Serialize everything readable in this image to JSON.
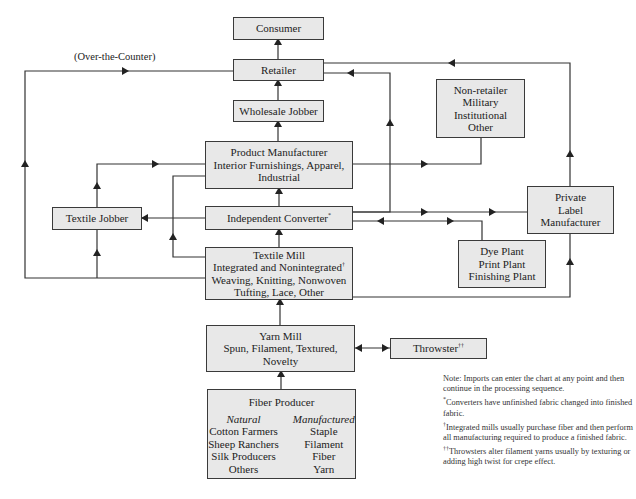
{
  "diagram": {
    "nodes": {
      "consumer": {
        "label": "Consumer"
      },
      "retailer": {
        "label": "Retailer"
      },
      "wholesale_jobber": {
        "label": "Wholesale Jobber"
      },
      "product_manufacturer": {
        "lines": [
          "Product Manufacturer",
          "Interior Furnishings, Apparel,",
          "Industrial"
        ]
      },
      "textile_jobber": {
        "label": "Textile Jobber"
      },
      "independent_converter": {
        "label": "Independent Converter",
        "mark": "*"
      },
      "textile_mill": {
        "lines": [
          "Textile Mill",
          "Integrated and Nonintegrated",
          "Weaving, Knitting, Nonwoven",
          "Tufting, Lace, Other"
        ],
        "mark": "†"
      },
      "yarn_mill": {
        "lines": [
          "Yarn Mill",
          "Spun, Filament, Textured,",
          "Novelty"
        ]
      },
      "throwster": {
        "label": "Throwster",
        "mark": "††"
      },
      "fiber_producer": {
        "title": "Fiber Producer",
        "natural": {
          "heading": "Natural",
          "items": [
            "Cotton Farmers",
            "Sheep Ranchers",
            "Silk Producers",
            "Others"
          ]
        },
        "manufactured": {
          "heading": "Manufactured",
          "items": [
            "Staple",
            "Filament",
            "Fiber",
            "Yarn"
          ]
        }
      },
      "non_retailer": {
        "lines": [
          "Non-retailer",
          "Military",
          "Institutional",
          "Other"
        ]
      },
      "private_label": {
        "lines": [
          "Private",
          "Label",
          "Manufacturer"
        ]
      },
      "dye_plant": {
        "lines": [
          "Dye Plant",
          "Print Plant",
          "Finishing Plant"
        ]
      }
    },
    "edge_labels": {
      "over_the_counter": "(Over-the-Counter)"
    },
    "notes": {
      "imports": "Note: Imports can enter the chart at any point and then continue in the processing sequence.",
      "converters": {
        "mark": "*",
        "text": "Converters have unfinished fabric changed into finished fabric."
      },
      "integrated": {
        "mark": "†",
        "text": "Integrated mills usually purchase fiber and then perform all manufacturing required to produce a finished fabric."
      },
      "throwsters": {
        "mark": "††",
        "text": "Throwsters alter filament yarns usually by texturing or adding high twist for crepe effect."
      }
    },
    "edges": [
      {
        "from": "Retailer",
        "to": "Consumer"
      },
      {
        "from": "Wholesale Jobber",
        "to": "Retailer"
      },
      {
        "from": "Product Manufacturer",
        "to": "Wholesale Jobber"
      },
      {
        "from": "Product Manufacturer",
        "to": "Non-retailer"
      },
      {
        "from": "Independent Converter",
        "to": "Product Manufacturer"
      },
      {
        "from": "Independent Converter",
        "to": "Textile Jobber"
      },
      {
        "from": "Independent Converter",
        "to": "Retailer"
      },
      {
        "from": "Independent Converter",
        "to": "Private Label Manufacturer"
      },
      {
        "from": "Independent Converter",
        "to": "Dye Plant",
        "bidirectional": true
      },
      {
        "from": "Textile Mill",
        "to": "Independent Converter"
      },
      {
        "from": "Textile Mill",
        "to": "Textile Jobber"
      },
      {
        "from": "Textile Mill",
        "to": "Product Manufacturer"
      },
      {
        "from": "Textile Mill",
        "to": "Retailer",
        "label": "(Over-the-Counter)"
      },
      {
        "from": "Textile Mill",
        "to": "Private Label Manufacturer"
      },
      {
        "from": "Textile Jobber",
        "to": "Product Manufacturer"
      },
      {
        "from": "Private Label Manufacturer",
        "to": "Retailer"
      },
      {
        "from": "Yarn Mill",
        "to": "Textile Mill"
      },
      {
        "from": "Yarn Mill",
        "to": "Throwster",
        "bidirectional": true
      },
      {
        "from": "Fiber Producer",
        "to": "Yarn Mill"
      }
    ]
  }
}
